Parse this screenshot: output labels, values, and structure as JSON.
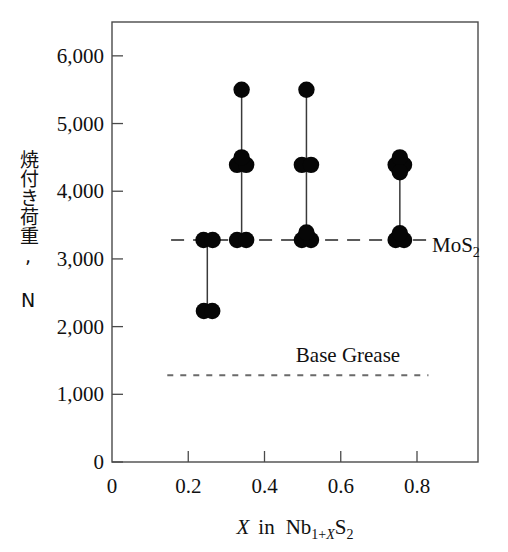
{
  "chart_data": {
    "type": "scatter",
    "title": "",
    "xlabel": "X in Nb1+XS2",
    "ylabel": "焼付き荷重, N",
    "xlim": [
      0,
      0.96
    ],
    "ylim": [
      0,
      6500
    ],
    "grid": false,
    "legend": "none",
    "x_ticks": [
      "0",
      "0.2",
      "0.4",
      "0.6",
      "0.8"
    ],
    "x_tick_values": [
      0,
      0.2,
      0.4,
      0.6,
      0.8
    ],
    "y_ticks": [
      "0",
      "1,000",
      "2,000",
      "3,000",
      "4,000",
      "5,000",
      "6,000"
    ],
    "y_tick_values": [
      0,
      1000,
      2000,
      3000,
      4000,
      5000,
      6000
    ],
    "series": [
      {
        "name": "X = 0.25",
        "x": 0.25,
        "range_low": 2230,
        "range_high": 3280,
        "points": [
          {
            "x": 0.24,
            "y": 3280
          },
          {
            "x": 0.264,
            "y": 3280
          },
          {
            "x": 0.241,
            "y": 2230
          },
          {
            "x": 0.263,
            "y": 2230
          }
        ]
      },
      {
        "name": "X = 0.34",
        "x": 0.34,
        "range_low": 3280,
        "range_high": 5500,
        "points": [
          {
            "x": 0.34,
            "y": 5500
          },
          {
            "x": 0.328,
            "y": 4390
          },
          {
            "x": 0.352,
            "y": 4390
          },
          {
            "x": 0.34,
            "y": 4500
          },
          {
            "x": 0.328,
            "y": 3280
          },
          {
            "x": 0.352,
            "y": 3280
          }
        ]
      },
      {
        "name": "X = 0.51",
        "x": 0.51,
        "range_low": 3280,
        "range_high": 5500,
        "points": [
          {
            "x": 0.51,
            "y": 5500
          },
          {
            "x": 0.498,
            "y": 4390
          },
          {
            "x": 0.522,
            "y": 4390
          },
          {
            "x": 0.498,
            "y": 3280
          },
          {
            "x": 0.522,
            "y": 3280
          },
          {
            "x": 0.51,
            "y": 3390
          }
        ]
      },
      {
        "name": "X = 0.755",
        "x": 0.755,
        "range_low": 3280,
        "range_high": 4400,
        "points": [
          {
            "x": 0.744,
            "y": 4390
          },
          {
            "x": 0.766,
            "y": 4390
          },
          {
            "x": 0.755,
            "y": 4500
          },
          {
            "x": 0.755,
            "y": 4280
          },
          {
            "x": 0.744,
            "y": 3280
          },
          {
            "x": 0.766,
            "y": 3280
          },
          {
            "x": 0.755,
            "y": 3380
          }
        ]
      }
    ],
    "reference_lines": [
      {
        "name": "MoS2",
        "label": "MoS",
        "label_sub": "2",
        "value": 3280,
        "style": "long-dash",
        "x_start": 0.155,
        "x_end": 0.855
      },
      {
        "name": "Base Grease",
        "label": "Base Grease",
        "label_sub": "",
        "value": 1280,
        "style": "short-dash",
        "x_start": 0.145,
        "x_end": 0.83
      }
    ],
    "annotations": [
      {
        "name": "mos2-ref-label",
        "text": "MoS",
        "sub": "2",
        "x": 0.88,
        "y": 3280
      },
      {
        "name": "base-grease-ref-label",
        "text": "Base Grease",
        "sub": "",
        "x": 0.625,
        "y": 1620
      }
    ]
  },
  "axes": {
    "x_title_prefix": "X",
    "x_title_mid": "in",
    "x_title_element": "Nb",
    "x_title_sub_a": "1+",
    "x_title_sub_b": "X",
    "x_title_element2": "S",
    "x_title_sub_c": "2",
    "y_title": "焼付き荷重, N"
  },
  "colors": {
    "marker": "#060606",
    "connector": "#3a3a3a",
    "frame": "#4a4a4a",
    "reference": "#5a5a5a",
    "background": "#ffffff",
    "text": "#111111"
  }
}
